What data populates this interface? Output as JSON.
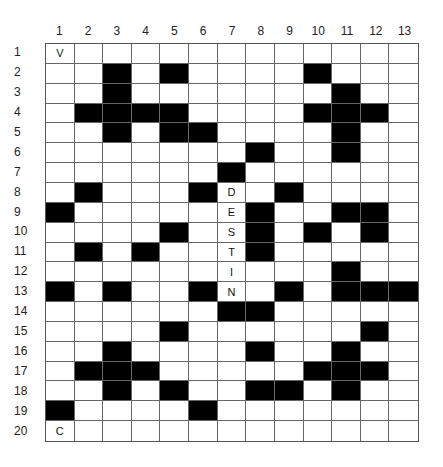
{
  "puzzle": {
    "type": "crossword",
    "columns": 13,
    "rows": 20,
    "column_labels": [
      "1",
      "2",
      "3",
      "4",
      "5",
      "6",
      "7",
      "8",
      "9",
      "10",
      "11",
      "12",
      "13"
    ],
    "row_labels": [
      "1",
      "2",
      "3",
      "4",
      "5",
      "6",
      "7",
      "8",
      "9",
      "10",
      "11",
      "12",
      "13",
      "14",
      "15",
      "16",
      "17",
      "18",
      "19",
      "20"
    ],
    "black_cells": {
      "1": [],
      "2": [
        3,
        5,
        10
      ],
      "3": [
        3,
        11
      ],
      "4": [
        2,
        3,
        4,
        5,
        10,
        11,
        12
      ],
      "5": [
        3,
        5,
        6,
        11
      ],
      "6": [
        8,
        11
      ],
      "7": [
        7
      ],
      "8": [
        2,
        6,
        9
      ],
      "9": [
        1,
        8,
        11,
        12
      ],
      "10": [
        5,
        8,
        10,
        12
      ],
      "11": [
        2,
        4,
        8
      ],
      "12": [
        11
      ],
      "13": [
        1,
        3,
        6,
        9,
        11,
        12,
        13
      ],
      "14": [
        7,
        8
      ],
      "15": [
        5,
        12
      ],
      "16": [
        3,
        8,
        11
      ],
      "17": [
        2,
        3,
        4,
        10,
        11,
        12
      ],
      "18": [
        3,
        5,
        8,
        9,
        11
      ],
      "19": [
        1,
        6
      ],
      "20": []
    },
    "letters": [
      {
        "row": 1,
        "col": 1,
        "char": "V"
      },
      {
        "row": 8,
        "col": 7,
        "char": "D"
      },
      {
        "row": 9,
        "col": 7,
        "char": "E"
      },
      {
        "row": 10,
        "col": 7,
        "char": "S"
      },
      {
        "row": 11,
        "col": 7,
        "char": "T"
      },
      {
        "row": 12,
        "col": 7,
        "char": "I"
      },
      {
        "row": 13,
        "col": 7,
        "char": "N"
      },
      {
        "row": 20,
        "col": 1,
        "char": "C"
      }
    ],
    "colors": {
      "black": "#000000",
      "white": "#ffffff",
      "grid_line": "#666666"
    }
  }
}
